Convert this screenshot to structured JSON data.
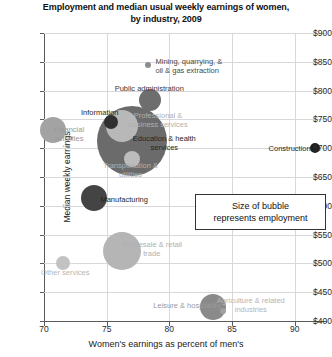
{
  "chart_data": {
    "type": "scatter",
    "title": "Employment and median usual weekly earnings of women, by industry, 2009",
    "title_line1": "Employment and median usual weekly earnings of women,",
    "title_line2": "by industry, 2009",
    "xlabel": "Women's earnings as percent of men's",
    "ylabel": "Median weekly earnings",
    "xlim": [
      70,
      92.5
    ],
    "ylim": [
      400,
      900
    ],
    "xticks": [
      70,
      75,
      80,
      85,
      90
    ],
    "xtick_labels": [
      "70",
      "75",
      "80",
      "85",
      "90"
    ],
    "yticks": [
      400,
      450,
      500,
      550,
      600,
      650,
      700,
      750,
      800,
      850,
      900
    ],
    "ytick_labels": [
      "$400",
      "$450",
      "$500",
      "$550",
      "$600",
      "$650",
      "$700",
      "$750",
      "$800",
      "$850",
      "$900"
    ],
    "grid": true,
    "legend_position": "inside-right",
    "annotation": "Size of bubble represents employment",
    "annotation_line1": "Size of bubble",
    "annotation_line2": "represents employment",
    "size_note": "Bubble area represents employment level",
    "points": [
      {
        "label": "Mining, quarrying, &\noil & gas extraction",
        "x": 78.3,
        "y": 845,
        "size": 3,
        "color": "#8d8d8d",
        "label_color": "#4a4a4a",
        "label_x": 78.9,
        "label_y": 843,
        "label_align": "left"
      },
      {
        "label": "Public administration",
        "x": 78.45,
        "y": 783,
        "size": 11,
        "color": "#6e6e6e",
        "label_color": "#3a3a3a",
        "label_x": 78.4,
        "label_y": 805,
        "label_align": "center"
      },
      {
        "label": "Information",
        "x": 75.35,
        "y": 746,
        "size": 7,
        "color": "#303030",
        "label_color": "#1f1f1f",
        "label_x": 74.45,
        "label_y": 762,
        "label_align": "center"
      },
      {
        "label": "Professional &\nbusiness services",
        "x": 76.25,
        "y": 739,
        "size": 16,
        "color": "#b8b8b8",
        "label_color": "#b0b0b0",
        "label_x": 79.1,
        "label_y": 749,
        "label_align": "center"
      },
      {
        "label": "Financial\nactivities",
        "x": 70.75,
        "y": 731,
        "size": 13,
        "color": "#a3a3a3",
        "label_color": "#9a9a9a",
        "label_x": 72.0,
        "label_y": 724,
        "label_align": "center"
      },
      {
        "label": "Education & health\nservices",
        "x": 77.0,
        "y": 712,
        "size": 35,
        "color": "#6b6b6b",
        "label_color": "#262626",
        "label_x": 79.6,
        "label_y": 709,
        "label_align": "center"
      },
      {
        "label": "Construction",
        "x": 91.6,
        "y": 700,
        "size": 5,
        "color": "#1f1f1f",
        "label_color": "#1f1f1f",
        "label_x": 89.6,
        "label_y": 700,
        "label_align": "center"
      },
      {
        "label": "Transportation &\nutilities",
        "x": 77.0,
        "y": 681,
        "size": 8,
        "color": "#bcbcbc",
        "label_color": "#b0b0b0",
        "label_x": 76.9,
        "label_y": 663,
        "label_align": "center"
      },
      {
        "label": "Manufacturing",
        "x": 73.95,
        "y": 613,
        "size": 13,
        "color": "#444444",
        "label_color": "#1f1f1f",
        "label_x": 76.4,
        "label_y": 612,
        "label_align": "center"
      },
      {
        "label": "Wholesale & retail\ntrade",
        "x": 76.2,
        "y": 522,
        "size": 19,
        "color": "#b5b5b5",
        "label_color": "#b0b0b0",
        "label_x": 78.6,
        "label_y": 525,
        "label_align": "center"
      },
      {
        "label": "Other services",
        "x": 71.55,
        "y": 500,
        "size": 7,
        "color": "#c2c2c2",
        "label_color": "#b5b5b5",
        "label_x": 71.7,
        "label_y": 485,
        "label_align": "center"
      },
      {
        "label": "Leisure & hospitality",
        "x": 83.5,
        "y": 425,
        "size": 13,
        "color": "#8a8a8a",
        "label_color": "#9a9a9a",
        "label_x": 81.4,
        "label_y": 427,
        "label_align": "center"
      },
      {
        "label": "Agriculture & related\nindustries",
        "x": 84.3,
        "y": 418,
        "size": 3,
        "color": "#a0a0a0",
        "label_color": "#b5b5b5",
        "label_x": 86.5,
        "label_y": 428,
        "label_align": "center"
      }
    ]
  }
}
